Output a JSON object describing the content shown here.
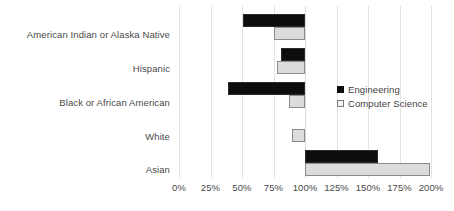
{
  "chart_data": {
    "type": "bar",
    "orientation": "horizontal",
    "title": "",
    "xlabel": "",
    "ylabel": "",
    "categories": [
      "American Indian or Alaska Native",
      "Hispanic",
      "Black or African American",
      "White",
      "Asian"
    ],
    "series": [
      {
        "name": "Engineering",
        "color": "#0d0d0d",
        "values": [
          51,
          81,
          39,
          100,
          158
        ]
      },
      {
        "name": "Computer Science",
        "color": "#dcdcdc",
        "values": [
          75,
          78,
          87,
          90,
          199
        ]
      }
    ],
    "baseline": 100,
    "xlim": [
      0,
      200
    ],
    "xticks": [
      0,
      25,
      50,
      75,
      100,
      125,
      150,
      175,
      200
    ],
    "xtick_labels": [
      "0%",
      "25%",
      "50%",
      "75%",
      "100%",
      "125%",
      "150%",
      "175%",
      "200%"
    ],
    "grid": true,
    "legend_position": "middle-right",
    "value_suffix": "%"
  },
  "legend": {
    "items": [
      {
        "label": "Engineering",
        "swatch": "filled-black-square"
      },
      {
        "label": "Computer Science",
        "swatch": "outlined-light-square"
      }
    ]
  },
  "colors": {
    "engineering": "#0d0d0d",
    "computer_science": "#dcdcdc",
    "computer_science_border": "#8a8a8a",
    "gridline": "#e3e3e3",
    "text": "#4a4a4a",
    "background": "#ffffff"
  }
}
